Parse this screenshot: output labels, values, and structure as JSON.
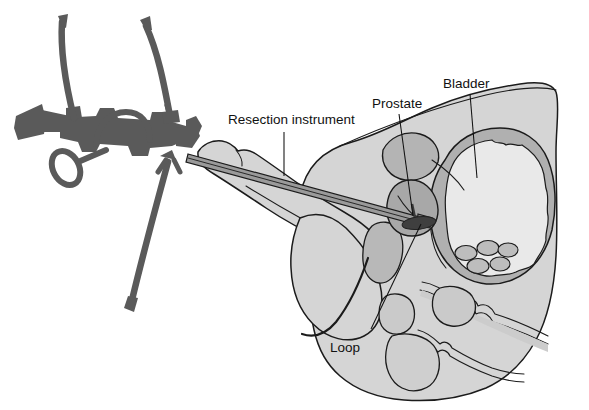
{
  "figure": {
    "background_color": "#ffffff",
    "width": 589,
    "height": 410
  },
  "palette": {
    "body_fill": "#d5d5d5",
    "body_fill_alt": "#cfcfcf",
    "organ_fill": "#b4b4b4",
    "organ_fill_dark": "#a8a8a8",
    "bladder_wall": "#b0b0b0",
    "bladder_lumen": "#e9e9e9",
    "instrument_dark": "#5a5a5a",
    "instrument_mid": "#9a9a9a",
    "loop_dark": "#3a3a3a",
    "outline": "#1b1b1b",
    "label_text": "#111111"
  },
  "labels": [
    {
      "id": "resection-instrument",
      "text": "Resection instrument",
      "text_x": 228,
      "text_y": 124,
      "anchor": "start",
      "leader": "M284,132 L284,176"
    },
    {
      "id": "prostate",
      "text": "Prostate",
      "text_x": 372,
      "text_y": 108,
      "anchor": "start",
      "leader": "M399,114 L413,216"
    },
    {
      "id": "bladder",
      "text": "Bladder",
      "text_x": 443,
      "text_y": 88,
      "anchor": "start",
      "leader": "M470,94 L477,178"
    },
    {
      "id": "loop",
      "text": "Loop",
      "text_x": 330,
      "text_y": 352,
      "anchor": "start",
      "leader": "M371,329 L421,224"
    }
  ],
  "structures": [
    {
      "id": "torso-body",
      "name": "pelvic body cross-section"
    },
    {
      "id": "penile-shaft",
      "name": "penile shaft with urethra"
    },
    {
      "id": "scrotum",
      "name": "scrotum"
    },
    {
      "id": "bladder",
      "name": "bladder with wall and lumen"
    },
    {
      "id": "prostate-gland",
      "name": "prostate gland"
    },
    {
      "id": "seminal-vesicle",
      "name": "seminal vesicle"
    },
    {
      "id": "rectum",
      "name": "rectum"
    },
    {
      "id": "pubic-bone",
      "name": "pubic bone"
    },
    {
      "id": "resectoscope",
      "name": "resectoscope handle and shaft"
    },
    {
      "id": "irrigation-tubing",
      "name": "irrigation tubing"
    },
    {
      "id": "cutting-loop",
      "name": "electrosurgical cutting loop"
    }
  ]
}
